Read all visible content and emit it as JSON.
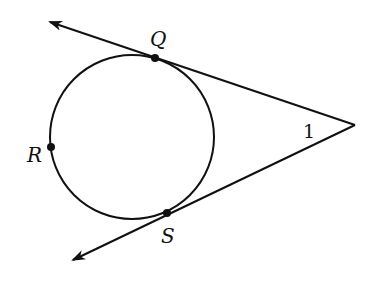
{
  "diagram": {
    "type": "geometry",
    "colors": {
      "stroke": "#111111",
      "background": "#ffffff"
    },
    "circle": {
      "cx": 132,
      "cy": 137,
      "r": 82
    },
    "vertex": {
      "x": 355,
      "y": 125
    },
    "points": [
      {
        "id": "Q",
        "label": "Q",
        "x": 155,
        "y": 58,
        "label_x": 150,
        "label_y": 46
      },
      {
        "id": "R",
        "label": "R",
        "x": 51,
        "y": 147,
        "label_x": 27,
        "label_y": 162
      },
      {
        "id": "S",
        "label": "S",
        "x": 167,
        "y": 213,
        "label_x": 161,
        "label_y": 243
      }
    ],
    "angle_label": {
      "text": "1",
      "x": 303,
      "y": 138
    },
    "rays": [
      {
        "name": "tangent-ray-Q",
        "from": [
          355,
          125
        ],
        "to": [
          50,
          22
        ]
      },
      {
        "name": "tangent-ray-S",
        "from": [
          355,
          125
        ],
        "to": [
          73,
          260
        ]
      }
    ]
  }
}
